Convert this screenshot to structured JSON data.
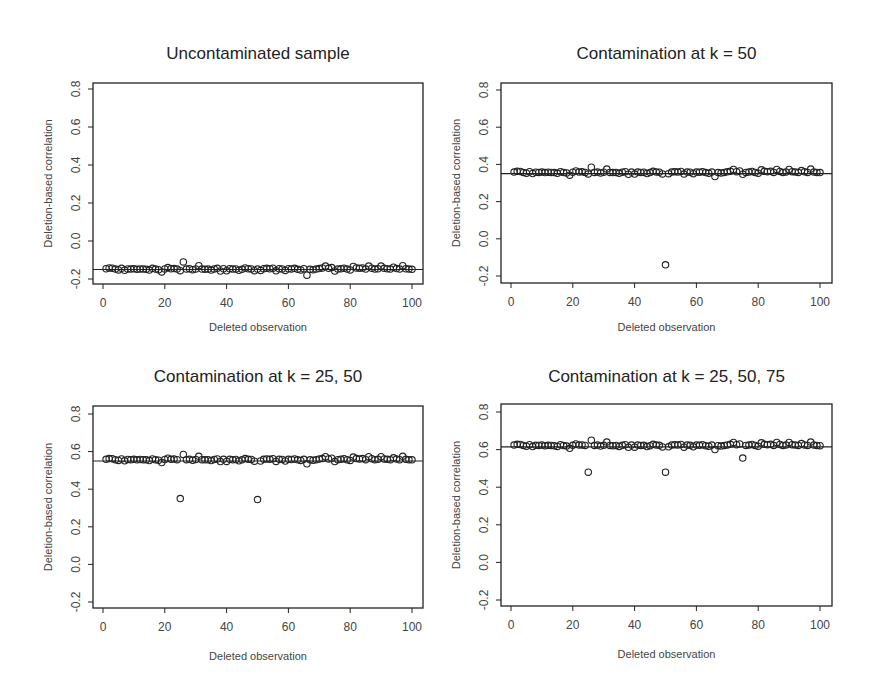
{
  "chart_data": [
    {
      "type": "scatter",
      "title": "Uncontaminated sample",
      "xlabel": "Deleted observation",
      "ylabel": "Deletion-based correlation",
      "xlim": [
        0,
        100
      ],
      "ylim": [
        -0.2,
        0.8
      ],
      "xticks": [
        0,
        20,
        40,
        60,
        80,
        100
      ],
      "yticks": [
        "-0.2",
        "0.0",
        "0.2",
        "0.4",
        "0.6",
        "0.8"
      ],
      "hline": -0.15,
      "baseline": -0.15,
      "outliers": [
        {
          "x": 26,
          "y": -0.11
        },
        {
          "x": 66,
          "y": -0.18
        }
      ],
      "grid": false
    },
    {
      "type": "scatter",
      "title": "Contamination at k = 50",
      "xlabel": "Deleted observation",
      "ylabel": "Deletion-based correlation",
      "xlim": [
        0,
        100
      ],
      "ylim": [
        -0.2,
        0.8
      ],
      "xticks": [
        0,
        20,
        40,
        60,
        80,
        100
      ],
      "yticks": [
        "-0.2",
        "0.0",
        "0.2",
        "0.4",
        "0.6",
        "0.8"
      ],
      "hline": 0.35,
      "baseline": 0.355,
      "outliers": [
        {
          "x": 50,
          "y": -0.14
        }
      ],
      "grid": false
    },
    {
      "type": "scatter",
      "title": "Contamination at k = 25, 50",
      "xlabel": "Deleted observation",
      "ylabel": "Deletion-based correlation",
      "xlim": [
        0,
        100
      ],
      "ylim": [
        -0.2,
        0.8
      ],
      "xticks": [
        0,
        20,
        40,
        60,
        80,
        100
      ],
      "yticks": [
        "-0.2",
        "0.0",
        "0.2",
        "0.4",
        "0.6",
        "0.8"
      ],
      "hline": 0.55,
      "baseline": 0.555,
      "outliers": [
        {
          "x": 25,
          "y": 0.35
        },
        {
          "x": 50,
          "y": 0.345
        }
      ],
      "grid": false
    },
    {
      "type": "scatter",
      "title": "Contamination at k = 25, 50, 75",
      "xlabel": "Deleted observation",
      "ylabel": "Deletion-based correlation",
      "xlim": [
        0,
        100
      ],
      "ylim": [
        -0.2,
        0.8
      ],
      "xticks": [
        0,
        20,
        40,
        60,
        80,
        100
      ],
      "yticks": [
        "-0.2",
        "0.0",
        "0.2",
        "0.4",
        "0.6",
        "0.8"
      ],
      "hline": 0.615,
      "baseline": 0.62,
      "outliers": [
        {
          "x": 25,
          "y": 0.48
        },
        {
          "x": 50,
          "y": 0.48
        },
        {
          "x": 75,
          "y": 0.555
        }
      ],
      "grid": false
    }
  ],
  "bumps": [
    0,
    0.004,
    0.008,
    0.007,
    0.002,
    -0.002,
    0.006,
    -0.004,
    0.003,
    0.002,
    0.004,
    0.001,
    0.003,
    0.002,
    0.001,
    -0.003,
    0.006,
    0.002,
    -0.001,
    -0.013,
    0.003,
    0.01,
    0.004,
    0.005,
    0.002,
    -0.006,
    0.03,
    0.002,
    0.004,
    -0.001,
    0.003,
    0.02,
    0.002,
    0.001,
    0.002,
    -0.003,
    0.003,
    0.006,
    -0.008,
    0.004,
    -0.007,
    0.004,
    0.002,
    0.003,
    -0.004,
    0.001,
    0.008,
    0.004,
    0.003,
    -0.006,
    0.002,
    -0.005,
    0.004,
    0.006,
    0.004,
    0.007,
    -0.007,
    0.004,
    0.003,
    -0.005,
    0.004,
    0.003,
    0.006,
    0.001,
    -0.002,
    0.004,
    -0.02,
    0.001,
    -0.001,
    0.002,
    0.005,
    0.008,
    0.018,
    0.006,
    0.01,
    -0.008,
    0.002,
    0.004,
    0.007,
    0.002,
    -0.002,
    0.016,
    0.008,
    0.006,
    0.008,
    0.002,
    0.018,
    0.007,
    0.002,
    0.004,
    0.018,
    0.006,
    0.004,
    0.002,
    0.012,
    0.005,
    0.002,
    0.02,
    0.004,
    0.002,
    0.001
  ]
}
